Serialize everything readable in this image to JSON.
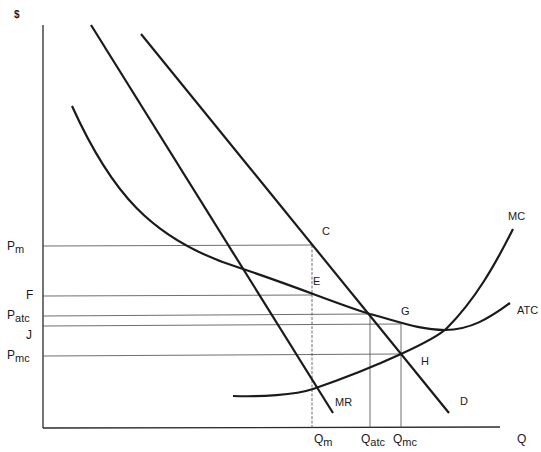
{
  "axes": {
    "y_label": "$",
    "x_label": "Q"
  },
  "price_levels": [
    {
      "label_main": "P",
      "label_sub": "m",
      "y": 246
    },
    {
      "label_main": "F",
      "label_sub": "",
      "y": 296
    },
    {
      "label_main": "P",
      "label_sub": "atc",
      "y": 316
    },
    {
      "label_main": "J",
      "label_sub": "",
      "y": 326
    },
    {
      "label_main": "P",
      "label_sub": "mc",
      "y": 356
    }
  ],
  "quantity_levels": [
    {
      "label_main": "Q",
      "label_sub": "m",
      "x": 312
    },
    {
      "label_main": "Q",
      "label_sub": "atc",
      "x": 370
    },
    {
      "label_main": "Q",
      "label_sub": "mc",
      "x": 401
    }
  ],
  "curves": {
    "mr": "MR",
    "d": "D",
    "mc": "MC",
    "atc": "ATC"
  },
  "points": {
    "c": "C",
    "e": "E",
    "g": "G",
    "h": "H"
  },
  "labels": {
    "pm_main": "P",
    "pm_sub": "m",
    "f": "F",
    "patc_main": "P",
    "patc_sub": "atc",
    "j": "J",
    "pmc_main": "P",
    "pmc_sub": "mc",
    "qm_main": "Q",
    "qm_sub": "m",
    "qatc_main": "Q",
    "qatc_sub": "atc",
    "qmc_main": "Q",
    "qmc_sub": "mc"
  },
  "colors": {
    "curve": "#1a1a1a",
    "guide": "#4a4a4a",
    "background": "#ffffff"
  }
}
